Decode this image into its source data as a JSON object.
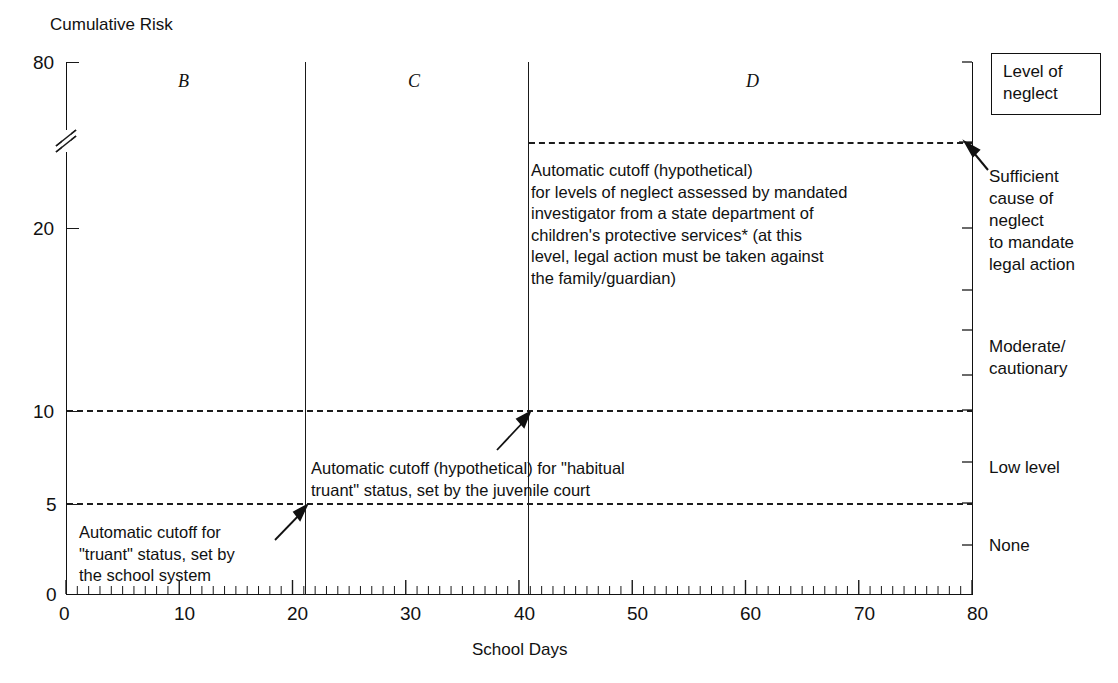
{
  "chart_data": {
    "type": "line",
    "title": "",
    "ylabel": "Cumulative Risk",
    "xlabel": "School Days",
    "xlim": [
      0,
      80
    ],
    "ylim": [
      0,
      80
    ],
    "grid": false,
    "legend_position": "right",
    "x_ticks": [
      "0",
      "10",
      "20",
      "30",
      "40",
      "50",
      "60",
      "70",
      "80"
    ],
    "x_tick_values": [
      0,
      10,
      20,
      30,
      40,
      50,
      60,
      70,
      80
    ],
    "x_minor_tick_interval": 1,
    "y_ticks": [
      "0",
      "5",
      "10",
      "20",
      "80"
    ],
    "y_tick_values": [
      0,
      5,
      10,
      20,
      80
    ],
    "y_axis_break": true,
    "y_axis_break_between": [
      20,
      80
    ],
    "region_dividers_x": [
      20,
      40
    ],
    "regions": [
      {
        "label": "B",
        "x_start": 0,
        "x_end": 20
      },
      {
        "label": "C",
        "x_start": 20,
        "x_end": 40
      },
      {
        "label": "D",
        "x_start": 40,
        "x_end": 80
      }
    ],
    "cutoff_lines": [
      {
        "name": "truant-cutoff",
        "y_value": 5,
        "x_start": 0,
        "x_end": 80,
        "style": "dashed"
      },
      {
        "name": "habitual-truant-cutoff",
        "y_value": 10,
        "x_start": 0,
        "x_end": 80,
        "style": "dashed"
      },
      {
        "name": "neglect-cutoff",
        "y_value": 40,
        "x_start": 40,
        "x_end": 80,
        "style": "dashed"
      }
    ],
    "right_axis_categories": [
      "Sufficient cause of neglect to mandate legal action",
      "Moderate/cautionary",
      "Low level",
      "None"
    ],
    "annotations": [
      "Automatic cutoff (hypothetical) for levels of neglect assessed by mandated investigator from a state department of children's protective services* (at this level, legal action must be taken against the family/guardian)",
      "Automatic cutoff (hypothetical) for \"habitual truant\" status, set by the juvenile court",
      "Automatic cutoff for \"truant\" status, set by the school system"
    ]
  },
  "axes": {
    "y_title": "Cumulative Risk",
    "x_title": "School Days",
    "y_ticks": [
      "80",
      "20",
      "10",
      "5",
      "0"
    ],
    "x_ticks": [
      "0",
      "10",
      "20",
      "30",
      "40",
      "50",
      "60",
      "70",
      "80"
    ]
  },
  "regions": {
    "b": "B",
    "c": "C",
    "d": "D"
  },
  "legend": {
    "title": "Level of\nneglect"
  },
  "right_labels": {
    "sufficient": "Sufficient\ncause of\nneglect\nto mandate\nlegal action",
    "moderate": "Moderate/\ncautionary",
    "low": "Low level",
    "none": "None"
  },
  "annotations": {
    "neglect_cutoff": "Automatic cutoff (hypothetical)\nfor levels of neglect assessed by mandated\ninvestigator from a state department of\nchildren's protective services* (at this\nlevel, legal action must be taken against\nthe family/guardian)",
    "habitual_truant": "Automatic cutoff (hypothetical) for \"habitual\ntruant\" status, set by the juvenile court",
    "truant": "Automatic cutoff for\n\"truant\" status, set by\nthe school system"
  },
  "colors": {
    "ink": "#111111",
    "background": "#ffffff",
    "dash": "#1c1c1c"
  }
}
